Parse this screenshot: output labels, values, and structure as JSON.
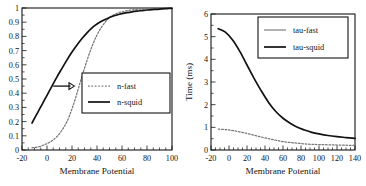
{
  "figure": {
    "panel_count": 2,
    "background_color": "#ffffff",
    "ink_color": "#141414"
  },
  "chart_data": [
    {
      "id": "left-panel",
      "type": "line",
      "title": "",
      "subtitle": "",
      "xlabel": "Membrane Potential",
      "ylabel": "",
      "xlim": [
        -20,
        100
      ],
      "ylim": [
        0,
        1
      ],
      "grid": false,
      "legend_position": "center-right",
      "x_major_ticks": [
        -20,
        0,
        20,
        40,
        60,
        80,
        100
      ],
      "x_major_tick_labels": [
        "-20",
        "0",
        "20",
        "40",
        "60",
        "80",
        "100"
      ],
      "x_minor_tick_step": 5,
      "y_major_ticks": [
        0,
        0.1,
        0.2,
        0.3,
        0.4,
        0.5,
        0.6,
        0.7,
        0.8,
        0.9,
        1
      ],
      "y_major_tick_labels": [
        "0",
        "0.1",
        "0.2",
        "0.3",
        "0.4",
        "0.5",
        "0.6",
        "0.7",
        "0.8",
        "0.9",
        "1"
      ],
      "annotations": [
        {
          "name": "shift-arrow",
          "kind": "arrow",
          "direction": "right",
          "x_start": 5,
          "x_end": 22,
          "y": 0.45
        }
      ],
      "series": [
        {
          "name": "n-fast",
          "style": "dotted",
          "color": "#777777",
          "x": [
            -12,
            -8,
            -4,
            0,
            4,
            8,
            12,
            16,
            20,
            24,
            28,
            32,
            36,
            40,
            44,
            48,
            52,
            56,
            60,
            64,
            68,
            72,
            76,
            80,
            84,
            88,
            92,
            96,
            100
          ],
          "y": [
            0.015,
            0.02,
            0.03,
            0.045,
            0.065,
            0.095,
            0.14,
            0.2,
            0.29,
            0.4,
            0.52,
            0.63,
            0.73,
            0.81,
            0.87,
            0.915,
            0.945,
            0.962,
            0.973,
            0.981,
            0.986,
            0.99,
            0.993,
            0.995,
            0.996,
            0.997,
            0.998,
            0.999,
            1.0
          ]
        },
        {
          "name": "n-squid",
          "style": "solid",
          "color": "#111111",
          "x": [
            -12,
            -8,
            -4,
            0,
            4,
            8,
            12,
            16,
            20,
            24,
            28,
            32,
            36,
            40,
            44,
            48,
            52,
            56,
            60,
            64,
            68,
            72,
            76,
            80,
            84,
            88,
            92,
            96,
            100
          ],
          "y": [
            0.19,
            0.255,
            0.32,
            0.385,
            0.45,
            0.515,
            0.575,
            0.635,
            0.69,
            0.74,
            0.785,
            0.825,
            0.86,
            0.887,
            0.908,
            0.925,
            0.94,
            0.951,
            0.96,
            0.967,
            0.973,
            0.978,
            0.982,
            0.986,
            0.989,
            0.991,
            0.994,
            0.996,
            0.998
          ]
        }
      ]
    },
    {
      "id": "right-panel",
      "type": "line",
      "title": "",
      "subtitle": "",
      "xlabel": "Membrane Potential",
      "ylabel": "Time (ms)",
      "xlim": [
        -20,
        140
      ],
      "ylim": [
        0,
        6
      ],
      "grid": false,
      "legend_position": "upper-right",
      "x_major_ticks": [
        -20,
        0,
        20,
        40,
        60,
        80,
        100,
        120,
        140
      ],
      "x_major_tick_labels": [
        "-20",
        "0",
        "20",
        "40",
        "60",
        "80",
        "100",
        "120",
        "140"
      ],
      "x_minor_tick_step": 5,
      "y_major_ticks": [
        0,
        1,
        2,
        3,
        4,
        5,
        6
      ],
      "y_major_tick_labels": [
        "0",
        "1",
        "2",
        "3",
        "4",
        "5",
        "6"
      ],
      "annotations": [],
      "series": [
        {
          "name": "tau-fast",
          "style": "dotted",
          "color": "#777777",
          "x": [
            -12,
            -4,
            4,
            12,
            20,
            28,
            36,
            44,
            52,
            60,
            68,
            76,
            84,
            92,
            100,
            110,
            120,
            130,
            140
          ],
          "y": [
            0.92,
            0.9,
            0.86,
            0.8,
            0.73,
            0.65,
            0.57,
            0.5,
            0.43,
            0.37,
            0.33,
            0.3,
            0.27,
            0.25,
            0.24,
            0.23,
            0.22,
            0.21,
            0.2
          ]
        },
        {
          "name": "tau-squid",
          "style": "solid",
          "color": "#111111",
          "x": [
            -12,
            -4,
            4,
            12,
            20,
            28,
            36,
            44,
            52,
            60,
            68,
            76,
            84,
            92,
            100,
            110,
            120,
            130,
            140
          ],
          "y": [
            5.35,
            5.2,
            4.85,
            4.35,
            3.75,
            3.15,
            2.6,
            2.1,
            1.7,
            1.4,
            1.18,
            1.0,
            0.88,
            0.78,
            0.71,
            0.64,
            0.59,
            0.55,
            0.51
          ]
        }
      ]
    }
  ]
}
